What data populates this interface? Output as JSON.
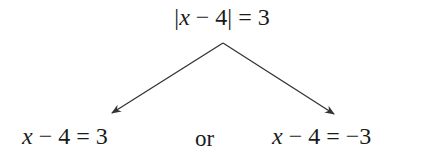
{
  "diagram": {
    "type": "branching-equation",
    "colors": {
      "text": "#1a1a1a",
      "arrow": "#333333",
      "background": "#ffffff"
    },
    "root": {
      "abs_open": "|",
      "var": "x",
      "minus": "−",
      "num": "4",
      "abs_close": "|",
      "equals": "=",
      "rhs": "3",
      "full_text": "|x − 4| = 3"
    },
    "connector": {
      "label": "or"
    },
    "branches": [
      {
        "var": "x",
        "minus": "−",
        "num": "4",
        "equals": "=",
        "rhs": "3",
        "full_text": "x − 4 = 3"
      },
      {
        "var": "x",
        "minus": "−",
        "num": "4",
        "equals": "=",
        "rhs": "−3",
        "full_text": "x − 4 = −3"
      }
    ],
    "arrows": [
      {
        "from": "root",
        "to": "branch-left"
      },
      {
        "from": "root",
        "to": "branch-right"
      }
    ]
  }
}
